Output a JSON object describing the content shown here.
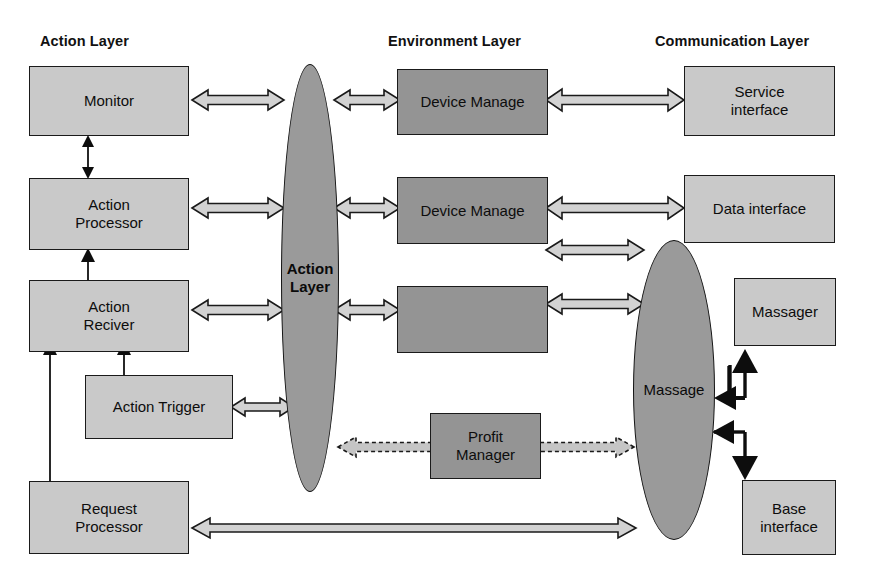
{
  "diagram": {
    "title_row": [
      {
        "id": "action-layer-title",
        "label": "Action Layer"
      },
      {
        "id": "environment-layer-title",
        "label": "Environment Layer"
      },
      {
        "id": "communication-layer-title",
        "label": "Communication Layer"
      }
    ],
    "colors": {
      "light_box_fill": "#c9c9c9",
      "dark_box_fill": "#949494",
      "ellipse_fill": "#9a9a9a",
      "outline": "#141414",
      "arrow_fill": "#d0d0d0",
      "background": "#ffffff"
    },
    "action_layer_nodes": [
      {
        "id": "monitor",
        "label": "Monitor"
      },
      {
        "id": "action-processor",
        "label": "Action\nProcessor",
        "line1": "Action",
        "line2": "Processor"
      },
      {
        "id": "action-reciver",
        "label": "Action\nReciver",
        "line1": "Action",
        "line2": "Reciver"
      },
      {
        "id": "action-trigger",
        "label": "Action Trigger"
      },
      {
        "id": "request-processor",
        "label": "Request\nProcessor",
        "line1": "Request",
        "line2": "Processor"
      }
    ],
    "environment_layer_nodes": [
      {
        "id": "device-manage-1",
        "label": "Device Manage"
      },
      {
        "id": "device-manage-2",
        "label": "Device Manage"
      },
      {
        "id": "device-manage-3",
        "label": ""
      },
      {
        "id": "profit-manager",
        "label": "Profit\nManager",
        "line1": "Profit",
        "line2": "Manager"
      }
    ],
    "communication_layer_nodes": [
      {
        "id": "service-interface",
        "label": "Service\ninterface",
        "line1": "Service",
        "line2": "interface"
      },
      {
        "id": "data-interface",
        "label": "Data interface"
      },
      {
        "id": "massager",
        "label": "Massager"
      },
      {
        "id": "base-interface",
        "label": "Base\ninterface",
        "line1": "Base",
        "line2": "interface"
      }
    ],
    "ellipses": [
      {
        "id": "action-layer-ellipse",
        "line1": "Action",
        "line2": "Layer",
        "bold": true
      },
      {
        "id": "massage-ellipse",
        "line1": "Massage",
        "line2": "",
        "bold": false
      }
    ],
    "connectors": [
      {
        "id": "monitor-to-action-layer",
        "style": "hollow-double",
        "from": "monitor",
        "to": "action-layer-ellipse"
      },
      {
        "id": "action-layer-to-device-manage-1",
        "style": "hollow-double",
        "from": "action-layer-ellipse",
        "to": "device-manage-1"
      },
      {
        "id": "device-manage-1-to-service-interface",
        "style": "hollow-double",
        "from": "device-manage-1",
        "to": "service-interface"
      },
      {
        "id": "monitor-to-action-processor",
        "style": "thin-double-vertical",
        "from": "monitor",
        "to": "action-processor"
      },
      {
        "id": "action-processor-to-action-layer",
        "style": "hollow-double",
        "from": "action-processor",
        "to": "action-layer-ellipse"
      },
      {
        "id": "action-layer-to-device-manage-2",
        "style": "hollow-double",
        "from": "action-layer-ellipse",
        "to": "device-manage-2"
      },
      {
        "id": "device-manage-2-to-data-interface",
        "style": "hollow-double",
        "from": "device-manage-2",
        "to": "data-interface"
      },
      {
        "id": "device-manage-2-to-massage",
        "style": "hollow-double",
        "from": "device-manage-2",
        "to": "massage-ellipse"
      },
      {
        "id": "action-reciver-to-action-processor",
        "style": "thin-single-vertical-up",
        "from": "action-reciver",
        "to": "action-processor"
      },
      {
        "id": "action-reciver-to-action-layer",
        "style": "hollow-double",
        "from": "action-reciver",
        "to": "action-layer-ellipse"
      },
      {
        "id": "action-layer-to-device-manage-3",
        "style": "hollow-double",
        "from": "action-layer-ellipse",
        "to": "device-manage-3"
      },
      {
        "id": "device-manage-3-to-massage",
        "style": "hollow-double",
        "from": "device-manage-3",
        "to": "massage-ellipse"
      },
      {
        "id": "action-trigger-to-action-reciver",
        "style": "thin-single-vertical-up",
        "from": "action-trigger",
        "to": "action-reciver"
      },
      {
        "id": "request-processor-to-action-reciver",
        "style": "thin-single-vertical-up",
        "from": "request-processor",
        "to": "action-reciver"
      },
      {
        "id": "action-trigger-to-action-layer",
        "style": "hollow-double",
        "from": "action-trigger",
        "to": "action-layer-ellipse"
      },
      {
        "id": "profit-manager-to-action-layer",
        "style": "dashed-hollow-arrow-left",
        "from": "profit-manager",
        "to": "action-layer-ellipse"
      },
      {
        "id": "profit-manager-to-massage",
        "style": "dashed-hollow-arrow-right",
        "from": "profit-manager",
        "to": "massage-ellipse"
      },
      {
        "id": "massage-to-massager",
        "style": "solid-elbow-up",
        "from": "massage-ellipse",
        "to": "massager"
      },
      {
        "id": "massage-to-base-interface",
        "style": "solid-elbow-down",
        "from": "massage-ellipse",
        "to": "base-interface"
      },
      {
        "id": "request-processor-to-massage",
        "style": "hollow-double-long",
        "from": "request-processor",
        "to": "massage-ellipse"
      }
    ]
  }
}
